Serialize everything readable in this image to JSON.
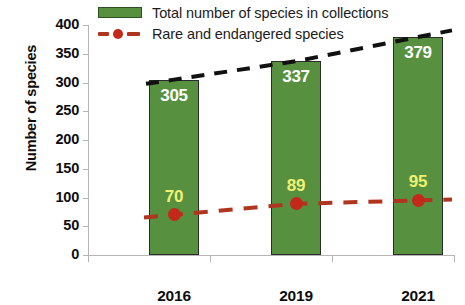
{
  "chart_data": {
    "type": "bar",
    "title": "",
    "xlabel": "",
    "ylabel": "Number of species",
    "categories": [
      "2016",
      "2019",
      "2021"
    ],
    "ylim": [
      0,
      400
    ],
    "ytick_step": 50,
    "yticks": [
      "400",
      "350",
      "300",
      "250",
      "200",
      "150",
      "100",
      "50",
      "0"
    ],
    "grid": false,
    "legend_position": "top",
    "series": [
      {
        "name": "Total number of species in collections",
        "type": "bar",
        "color": "#57913f",
        "label_color": "#ffffff",
        "values": [
          305,
          337,
          379
        ],
        "labels": [
          "305",
          "337",
          "379"
        ]
      },
      {
        "name": "Rare and endangered species",
        "type": "line",
        "color": "#b03520",
        "marker_color": "#c3281a",
        "label_color": "#f0f073",
        "values": [
          70,
          89,
          95
        ],
        "labels": [
          "70",
          "89",
          "95"
        ]
      }
    ],
    "trendline": {
      "name": "total-trendline",
      "style": "dashed",
      "color": "#111111",
      "values": [
        305,
        337,
        379
      ]
    }
  },
  "legend": {
    "items": [
      {
        "label": "Total number of species in collections",
        "marker": "bar-swatch-icon"
      },
      {
        "label": "Rare and endangered species",
        "marker": "dashed-line-marker-icon"
      }
    ]
  },
  "axes": {
    "y_title": "Number of species"
  }
}
